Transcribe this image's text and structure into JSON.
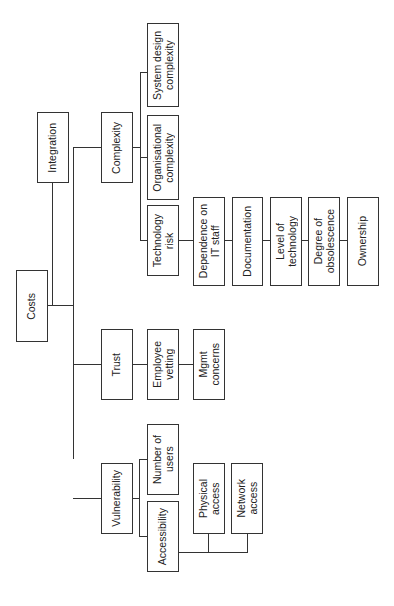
{
  "diagram": {
    "type": "hierarchy-tree",
    "orientation": "rotated-90-ccw",
    "root": "Costs",
    "nodes": {
      "costs": "Costs",
      "integration": "Integration",
      "complexity": "Complexity",
      "system_design_complexity": "System design\ncomplexity",
      "organisational_complexity": "Organisational\ncomplexity",
      "technology_risk": "Technology\nrisk",
      "dependence_on_it_staff": "Dependence on\nIT staff",
      "documentation": "Documentation",
      "level_of_technology": "Level of\ntechnology",
      "degree_of_obsolescence": "Degree of\nobsolescence",
      "ownership": "Ownership",
      "trust": "Trust",
      "employee_vetting": "Employee\nvetting",
      "mgmt_concerns": "Mgmt\nconcerns",
      "vulnerability": "Vulnerability",
      "number_of_users": "Number of\nusers",
      "accessibility": "Accessibility",
      "physical_access": "Physical\naccess",
      "network_access": "Network\naccess"
    },
    "edges": [
      [
        "Costs",
        "Integration"
      ],
      [
        "Costs",
        "Complexity"
      ],
      [
        "Costs",
        "Trust"
      ],
      [
        "Costs",
        "Vulnerability"
      ],
      [
        "Complexity",
        "System design complexity"
      ],
      [
        "Complexity",
        "Organisational complexity"
      ],
      [
        "Complexity",
        "Technology risk"
      ],
      [
        "Technology risk",
        "Dependence on IT staff"
      ],
      [
        "Technology risk",
        "Documentation"
      ],
      [
        "Technology risk",
        "Level of technology"
      ],
      [
        "Technology risk",
        "Degree of obsolescence"
      ],
      [
        "Technology risk",
        "Ownership"
      ],
      [
        "Trust",
        "Employee vetting"
      ],
      [
        "Trust",
        "Mgmt concerns"
      ],
      [
        "Vulnerability",
        "Number of users"
      ],
      [
        "Vulnerability",
        "Accessibility"
      ],
      [
        "Accessibility",
        "Physical access"
      ],
      [
        "Accessibility",
        "Network access"
      ]
    ]
  }
}
